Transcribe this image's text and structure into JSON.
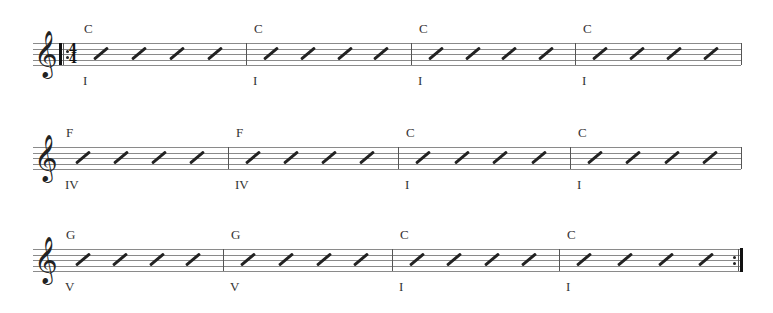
{
  "score": {
    "clef": "treble-clef",
    "time_signature": {
      "top": "4",
      "bottom": "4"
    },
    "repeat_start": true,
    "repeat_end": true,
    "systems": [
      {
        "staff_top": 43,
        "staff_left": 33,
        "staff_right": 741,
        "measures": [
          {
            "chord": "C",
            "roman": "I",
            "start": 64,
            "end": 246,
            "beats": 4
          },
          {
            "chord": "C",
            "roman": "I",
            "start": 246,
            "end": 411,
            "beats": 4
          },
          {
            "chord": "C",
            "roman": "I",
            "start": 411,
            "end": 575,
            "beats": 4
          },
          {
            "chord": "C",
            "roman": "I",
            "start": 575,
            "end": 741,
            "beats": 4
          }
        ]
      },
      {
        "staff_top": 147,
        "staff_left": 33,
        "staff_right": 741,
        "measures": [
          {
            "chord": "F",
            "roman": "IV",
            "start": 58,
            "end": 228,
            "beats": 4
          },
          {
            "chord": "F",
            "roman": "IV",
            "start": 228,
            "end": 398,
            "beats": 4
          },
          {
            "chord": "C",
            "roman": "I",
            "start": 398,
            "end": 570,
            "beats": 4
          },
          {
            "chord": "C",
            "roman": "I",
            "start": 570,
            "end": 741,
            "beats": 4
          }
        ]
      },
      {
        "staff_top": 249,
        "staff_left": 33,
        "staff_right": 743,
        "measures": [
          {
            "chord": "G",
            "roman": "V",
            "start": 58,
            "end": 223,
            "beats": 4
          },
          {
            "chord": "G",
            "roman": "V",
            "start": 223,
            "end": 392,
            "beats": 4
          },
          {
            "chord": "C",
            "roman": "I",
            "start": 392,
            "end": 559,
            "beats": 4
          },
          {
            "chord": "C",
            "roman": "I",
            "start": 559,
            "end": 740,
            "beats": 4
          }
        ]
      }
    ]
  }
}
